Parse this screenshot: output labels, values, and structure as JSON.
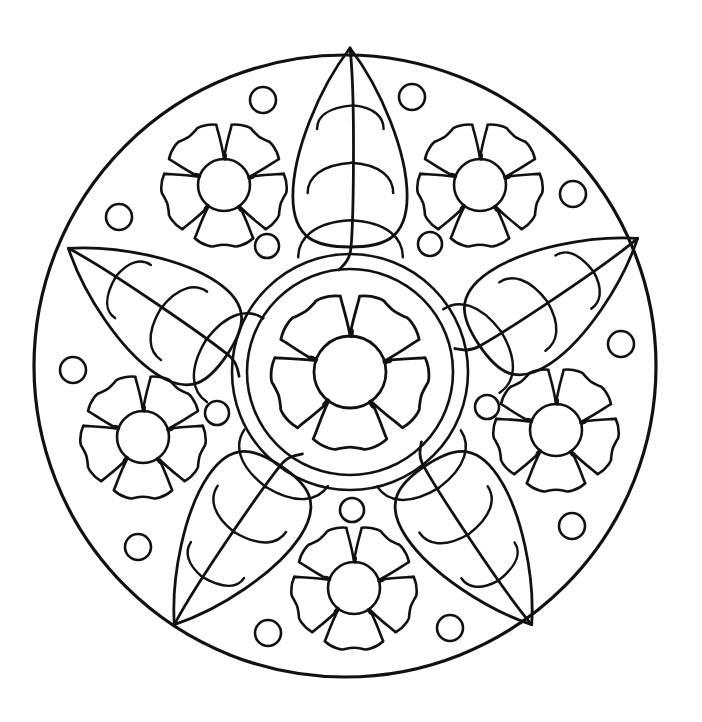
{
  "document": {
    "title": "Flower and Leaf Mandala Coloring Page",
    "type": "line-art-coloring-page",
    "background_color": "#ffffff",
    "ink_color": "#111111",
    "canvas": {
      "width": 702,
      "height": 722
    }
  },
  "artwork": {
    "outer_ring": {
      "name": "outer-boundary-circle",
      "cx": 345,
      "cy": 366,
      "r": 311,
      "stroke_width": 3.2
    },
    "inner_ring": {
      "name": "center-medallion-ring",
      "cx": 350,
      "cy": 372,
      "r_outer": 118,
      "r_inner": 103,
      "stroke_width": 2.6
    },
    "center_flower": {
      "name": "center-rose",
      "cx": 350,
      "cy": 372,
      "petal_count": 5,
      "outer_radius": 78,
      "core_radius": 36,
      "rotation_deg": 0,
      "stroke_width": 2.8
    },
    "small_flowers": [
      {
        "name": "flower-upper-left",
        "cx": 224,
        "cy": 185,
        "r": 62,
        "rotation_deg": 0
      },
      {
        "name": "flower-upper-right",
        "cx": 480,
        "cy": 185,
        "r": 62,
        "rotation_deg": 0
      },
      {
        "name": "flower-lower-left",
        "cx": 143,
        "cy": 437,
        "r": 62,
        "rotation_deg": 0
      },
      {
        "name": "flower-lower-right",
        "cx": 556,
        "cy": 430,
        "r": 62,
        "rotation_deg": 0
      },
      {
        "name": "flower-bottom",
        "cx": 354,
        "cy": 588,
        "r": 62,
        "rotation_deg": 0
      }
    ],
    "small_flower_style": {
      "petal_count": 5,
      "core_radius": 26,
      "stroke_width": 2.6
    },
    "leaves": [
      {
        "name": "leaf-top",
        "cx": 350,
        "cy": 148,
        "length": 100,
        "width": 56,
        "rotation_deg": 0
      },
      {
        "name": "leaf-left",
        "cx": 148,
        "cy": 302,
        "length": 96,
        "width": 54,
        "rotation_deg": -56
      },
      {
        "name": "leaf-right",
        "cx": 558,
        "cy": 292,
        "length": 96,
        "width": 54,
        "rotation_deg": 56
      },
      {
        "name": "leaf-bottom-left",
        "cx": 228,
        "cy": 545,
        "length": 96,
        "width": 54,
        "rotation_deg": -146
      },
      {
        "name": "leaf-bottom-right",
        "cx": 478,
        "cy": 545,
        "length": 96,
        "width": 54,
        "rotation_deg": 146
      }
    ],
    "leaf_style": {
      "stroke_width": 2.8,
      "side_vein_count": 3,
      "has_stem": true
    },
    "dots": [
      {
        "name": "dot-top-left",
        "cx": 263,
        "cy": 100,
        "r": 13
      },
      {
        "name": "dot-top-right",
        "cx": 412,
        "cy": 97,
        "r": 13
      },
      {
        "name": "dot-upper-far-left",
        "cx": 119,
        "cy": 217,
        "r": 13
      },
      {
        "name": "dot-upper-far-right",
        "cx": 573,
        "cy": 194,
        "r": 13
      },
      {
        "name": "dot-inner-upper-left",
        "cx": 267,
        "cy": 246,
        "r": 12
      },
      {
        "name": "dot-inner-upper-right",
        "cx": 430,
        "cy": 244,
        "r": 12
      },
      {
        "name": "dot-mid-left",
        "cx": 73,
        "cy": 370,
        "r": 13
      },
      {
        "name": "dot-mid-right",
        "cx": 621,
        "cy": 344,
        "r": 13
      },
      {
        "name": "dot-inner-left",
        "cx": 217,
        "cy": 413,
        "r": 12
      },
      {
        "name": "dot-inner-right",
        "cx": 487,
        "cy": 407,
        "r": 12
      },
      {
        "name": "dot-lower-left",
        "cx": 138,
        "cy": 547,
        "r": 13
      },
      {
        "name": "dot-lower-right",
        "cx": 572,
        "cy": 526,
        "r": 13
      },
      {
        "name": "dot-bottom-center",
        "cx": 352,
        "cy": 510,
        "r": 12
      },
      {
        "name": "dot-bottom-left",
        "cx": 268,
        "cy": 633,
        "r": 13
      },
      {
        "name": "dot-bottom-right",
        "cx": 450,
        "cy": 628,
        "r": 13
      }
    ]
  }
}
